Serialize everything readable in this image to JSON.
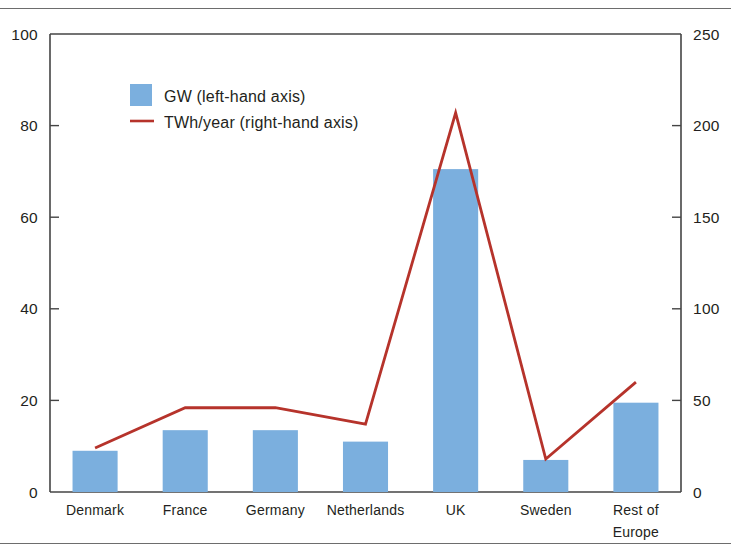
{
  "chart_data": {
    "type": "bar",
    "title": "",
    "subtitle": "",
    "xlabel": "",
    "ylabel": "",
    "categories": [
      "Denmark",
      "France",
      "Germany",
      "Netherlands",
      "UK",
      "Sweden",
      "Rest of\nEurope"
    ],
    "category_lines": [
      [
        "Denmark"
      ],
      [
        "France"
      ],
      [
        "Germany"
      ],
      [
        "Netherlands"
      ],
      [
        "UK"
      ],
      [
        "Sweden"
      ],
      [
        "Rest of",
        "Europe"
      ]
    ],
    "grid": false,
    "legend_position": "top-left-inside",
    "axes": {
      "left": {
        "label": "GW",
        "min": 0,
        "max": 100,
        "step": 20,
        "ticks": [
          "0",
          "20",
          "40",
          "60",
          "80",
          "100"
        ],
        "tick_values": [
          0,
          20,
          40,
          60,
          80,
          100
        ]
      },
      "right": {
        "label": "TWh/year",
        "min": 0,
        "max": 250,
        "step": 50,
        "ticks": [
          "0",
          "50",
          "100",
          "150",
          "200",
          "250"
        ],
        "tick_values": [
          0,
          50,
          100,
          150,
          200,
          250
        ]
      }
    },
    "series": [
      {
        "name": "GW (left-hand axis)",
        "type": "bar",
        "axis": "left",
        "color": "#7BAFDE",
        "values": [
          9,
          13.5,
          13.5,
          11,
          70.5,
          7,
          19.5
        ]
      },
      {
        "name": "TWh/year (right-hand axis)",
        "type": "line",
        "axis": "right",
        "color": "#B6332B",
        "values": [
          24,
          46,
          46,
          37,
          207,
          18,
          60
        ]
      }
    ],
    "legend": [
      {
        "label": "GW (left-hand axis)",
        "marker": "swatch",
        "color": "#7BAFDE"
      },
      {
        "label": "TWh/year (right-hand axis)",
        "marker": "line",
        "color": "#B6332B"
      }
    ],
    "colors": {
      "bar": "#7BAFDE",
      "line": "#B6332B",
      "axis": "#444444",
      "rule": "#6d6d6d",
      "text": "#231f20",
      "background": "#ffffff"
    }
  }
}
